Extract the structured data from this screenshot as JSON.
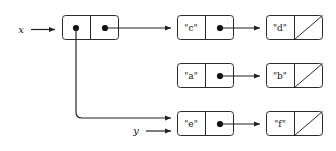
{
  "diagram": {
    "type": "box-and-pointer",
    "background_color": "#ffffff",
    "stroke_color": "#2b2b2b",
    "line_color": "#222222",
    "dot_color": "#111111",
    "variables": [
      {
        "id": "x",
        "label": "x",
        "points_to": "node-root"
      },
      {
        "id": "y",
        "label": "y",
        "points_to": "node-e"
      }
    ],
    "nodes": [
      {
        "id": "node-root",
        "car": {
          "kind": "pointer",
          "value": "",
          "target": "node-e"
        },
        "cdr": {
          "kind": "pointer",
          "value": "",
          "target": "node-c"
        }
      },
      {
        "id": "node-c",
        "car": {
          "kind": "value",
          "value": "\"c\""
        },
        "cdr": {
          "kind": "pointer",
          "value": "",
          "target": "node-d"
        }
      },
      {
        "id": "node-d",
        "car": {
          "kind": "value",
          "value": "\"d\""
        },
        "cdr": {
          "kind": "nil",
          "value": ""
        }
      },
      {
        "id": "node-a",
        "car": {
          "kind": "value",
          "value": "\"a\""
        },
        "cdr": {
          "kind": "pointer",
          "value": "",
          "target": "node-b"
        }
      },
      {
        "id": "node-b",
        "car": {
          "kind": "value",
          "value": "\"b\""
        },
        "cdr": {
          "kind": "nil",
          "value": ""
        }
      },
      {
        "id": "node-e",
        "car": {
          "kind": "value",
          "value": "\"e\""
        },
        "cdr": {
          "kind": "pointer",
          "value": "",
          "target": "node-f"
        }
      },
      {
        "id": "node-f",
        "car": {
          "kind": "value",
          "value": "\"f\""
        },
        "cdr": {
          "kind": "nil",
          "value": ""
        }
      }
    ],
    "labels": {
      "c": "\"c\"",
      "d": "\"d\"",
      "a": "\"a\"",
      "b": "\"b\"",
      "e": "\"e\"",
      "f": "\"f\"",
      "x": "x",
      "y": "y"
    }
  }
}
